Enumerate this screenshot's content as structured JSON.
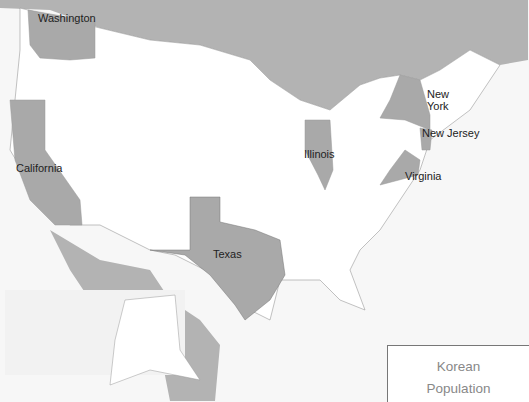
{
  "map": {
    "title": "Korean Population",
    "colors": {
      "highlight": "#a9a9a9",
      "foreign": "#b3b3b3",
      "us_state": "#ffffff",
      "water": "#f7f7f7",
      "border": "#999999"
    },
    "highlighted_states": [
      {
        "name": "Washington",
        "label": "Washington"
      },
      {
        "name": "California",
        "label": "California"
      },
      {
        "name": "Texas",
        "label": "Texas"
      },
      {
        "name": "Illinois",
        "label": "Illinois"
      },
      {
        "name": "New York",
        "label": "New York"
      },
      {
        "name": "New Jersey",
        "label": "New Jersey"
      },
      {
        "name": "Virginia",
        "label": "Virginia"
      }
    ]
  },
  "legend": {
    "title_line1": "Korean",
    "title_line2": "Population"
  }
}
